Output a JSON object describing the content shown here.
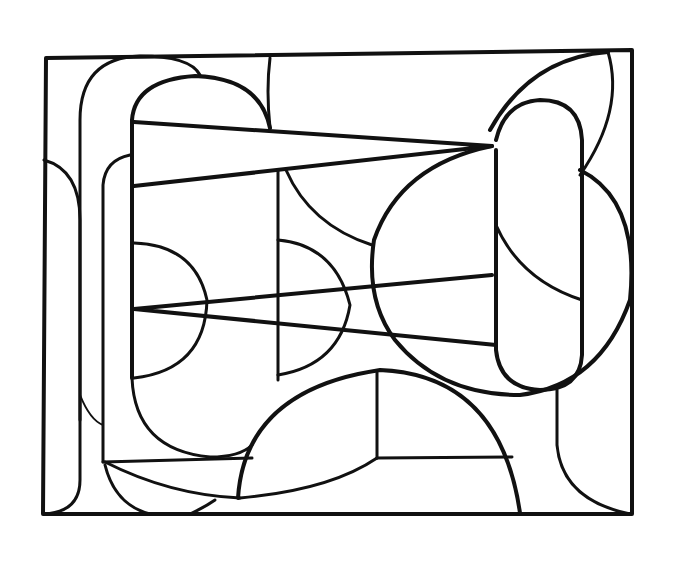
{
  "artwork": {
    "kind": "abstract geometric line drawing",
    "stroke_color": "#111111",
    "background_color": "#ffffff"
  }
}
